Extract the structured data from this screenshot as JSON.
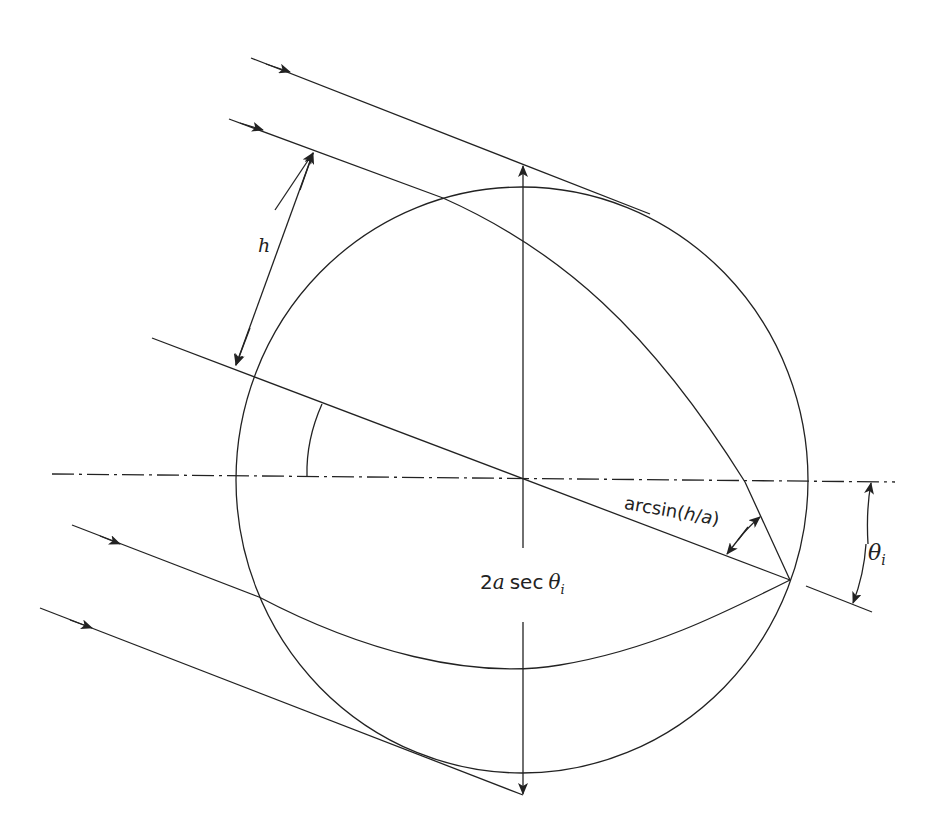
{
  "diagram": {
    "type": "ray optics: parallel rays incident on a sphere",
    "stroke_color": "#222222",
    "background": "#ffffff",
    "labels": {
      "h": "h",
      "arcsin": {
        "prefix": "arcsin(",
        "h": "h",
        "slash": "/",
        "a": "a",
        "suffix": ")"
      },
      "diameter": {
        "two": "2",
        "a": "a",
        "sec": "sec",
        "theta": "θ",
        "sub": "i"
      },
      "theta_i": {
        "theta": "θ",
        "sub": "i"
      }
    },
    "elements": [
      "circle (sphere cross-section)",
      "dash-dot optical axis",
      "4 incident parallel rays with arrows",
      "refracted curved ray to focal point",
      "caustic / tangent ray paths",
      "diameter line through center",
      "dimension arrow h",
      "dimension arrow 2a sec θi",
      "angle arc arcsin(h/a)",
      "angle arc θi"
    ]
  }
}
